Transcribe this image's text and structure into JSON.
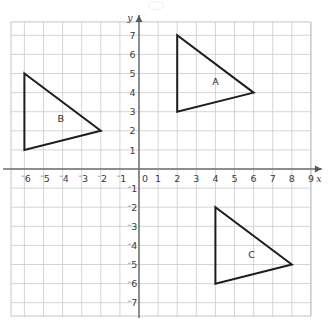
{
  "chart_data": {
    "type": "scatter",
    "title": "",
    "xlabel": "x",
    "ylabel": "y",
    "grid": true,
    "legend_position": "none",
    "xlim": [
      -6.7,
      9.0
    ],
    "ylim": [
      -7.7,
      7.7
    ],
    "x_tick_labels": [
      "-6",
      "-5",
      "-4",
      "-3",
      "-2",
      "-1",
      "0",
      "1",
      "2",
      "3",
      "4",
      "5",
      "6",
      "7",
      "8",
      "9"
    ],
    "x_tick_values": [
      -6,
      -5,
      -4,
      -3,
      -2,
      -1,
      0,
      1,
      2,
      3,
      4,
      5,
      6,
      7,
      8,
      9
    ],
    "y_tick_labels": [
      "7",
      "6",
      "5",
      "4",
      "3",
      "2",
      "1",
      "-1",
      "-2",
      "-3",
      "-4",
      "-5",
      "-6",
      "-7"
    ],
    "y_tick_values": [
      7,
      6,
      5,
      4,
      3,
      2,
      1,
      -1,
      -2,
      -3,
      -4,
      -5,
      -6,
      -7
    ],
    "origin_label": "0",
    "shapes": [
      {
        "label": "A",
        "label_x": 4.0,
        "label_y": 4.6,
        "vertices": [
          [
            2,
            7
          ],
          [
            2,
            3
          ],
          [
            6,
            4
          ]
        ]
      },
      {
        "label": "B",
        "label_x": -4.1,
        "label_y": 2.65,
        "vertices": [
          [
            -6,
            5
          ],
          [
            -6,
            1
          ],
          [
            -2,
            2
          ]
        ]
      },
      {
        "label": "C",
        "label_x": 5.9,
        "label_y": -4.5,
        "vertices": [
          [
            4,
            -2
          ],
          [
            4,
            -6
          ],
          [
            8,
            -5
          ]
        ]
      }
    ],
    "colors": {
      "grid": "#c9c9c9",
      "axis": "#6e6e6e",
      "shape_outline": "#1d1d1d",
      "text": "#3b3b3b",
      "background": "#ffffff"
    }
  }
}
